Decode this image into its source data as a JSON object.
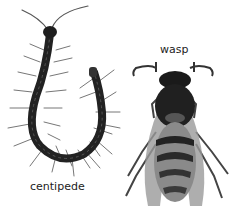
{
  "labels": {
    "centipede": "centipede",
    "wasp": "wasp"
  }
}
